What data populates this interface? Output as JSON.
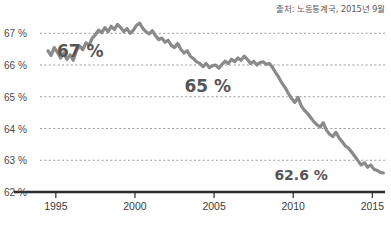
{
  "source_note": "출처: 노동통계국, 2015년 9월",
  "colors": {
    "line": "#8a8a8a",
    "gridline": "#9a9a9a",
    "axis": "#2b2b2b",
    "text": "#4a4a4a",
    "annotation": "#555555",
    "background": "#ffffff"
  },
  "annotations": [
    {
      "name": "annot-67",
      "text": "67 %",
      "x": 2.55,
      "y": 66.45
    },
    {
      "name": "annot-65",
      "text": "65 %",
      "x": 10.6,
      "y": 65.35
    },
    {
      "name": "annot-626",
      "text": "62.6 %",
      "x": 16.5,
      "y": 62.52
    }
  ],
  "chart_data": {
    "type": "line",
    "title": "",
    "subtitle": "",
    "xlabel": "",
    "ylabel": "",
    "xlim": [
      1994.0,
      2015.8
    ],
    "ylim": [
      62.0,
      67.45
    ],
    "grid": true,
    "grid_axis": "y",
    "legend": "none",
    "y_ticks": [
      62,
      63,
      64,
      65,
      66,
      67
    ],
    "y_ticklabels": [
      "62 %",
      "63 %",
      "64 %",
      "65 %",
      "66 %",
      "67 %"
    ],
    "x_ticks": [
      1995,
      2000,
      2005,
      2010,
      2015
    ],
    "x_ticklabels": [
      "1995",
      "2000",
      "2005",
      "2010",
      "2015"
    ],
    "series": [
      {
        "name": "Labor force participation rate",
        "units": "percent",
        "x": [
          1994.5,
          1994.7,
          1994.9,
          1995.1,
          1995.3,
          1995.5,
          1995.7,
          1995.9,
          1996.1,
          1996.3,
          1996.5,
          1996.7,
          1996.9,
          1997.1,
          1997.3,
          1997.5,
          1997.7,
          1997.9,
          1998.1,
          1998.3,
          1998.5,
          1998.7,
          1998.9,
          1999.1,
          1999.3,
          1999.5,
          1999.7,
          1999.9,
          2000.1,
          2000.3,
          2000.5,
          2000.7,
          2000.9,
          2001.1,
          2001.3,
          2001.5,
          2001.7,
          2001.9,
          2002.1,
          2002.3,
          2002.5,
          2002.7,
          2002.9,
          2003.1,
          2003.3,
          2003.5,
          2003.7,
          2003.9,
          2004.1,
          2004.3,
          2004.5,
          2004.7,
          2004.9,
          2005.1,
          2005.3,
          2005.5,
          2005.7,
          2005.9,
          2006.1,
          2006.3,
          2006.5,
          2006.7,
          2006.9,
          2007.1,
          2007.3,
          2007.5,
          2007.7,
          2007.9,
          2008.1,
          2008.3,
          2008.5,
          2008.7,
          2008.9,
          2009.1,
          2009.3,
          2009.5,
          2009.7,
          2009.9,
          2010.1,
          2010.3,
          2010.5,
          2010.7,
          2010.9,
          2011.1,
          2011.3,
          2011.5,
          2011.7,
          2011.9,
          2012.1,
          2012.3,
          2012.5,
          2012.7,
          2012.9,
          2013.1,
          2013.3,
          2013.5,
          2013.7,
          2013.9,
          2014.1,
          2014.3,
          2014.5,
          2014.7,
          2014.9,
          2015.1,
          2015.3,
          2015.5,
          2015.7
        ],
        "y": [
          66.45,
          66.3,
          66.55,
          66.4,
          66.22,
          66.38,
          66.18,
          66.32,
          66.15,
          66.45,
          66.6,
          66.48,
          66.7,
          66.62,
          66.85,
          66.95,
          67.1,
          67.02,
          67.18,
          67.05,
          67.22,
          67.12,
          67.28,
          67.18,
          67.05,
          67.15,
          67.0,
          67.1,
          67.25,
          67.32,
          67.15,
          67.05,
          66.98,
          67.08,
          66.92,
          66.8,
          66.85,
          66.72,
          66.78,
          66.62,
          66.55,
          66.68,
          66.5,
          66.38,
          66.45,
          66.28,
          66.2,
          66.1,
          66.05,
          65.95,
          66.05,
          65.92,
          65.98,
          66.0,
          65.9,
          66.02,
          66.12,
          66.05,
          66.18,
          66.1,
          66.22,
          66.15,
          66.28,
          66.18,
          66.05,
          66.12,
          66.0,
          66.08,
          66.1,
          66.02,
          66.05,
          65.92,
          65.75,
          65.6,
          65.42,
          65.28,
          65.1,
          64.95,
          64.82,
          64.98,
          64.72,
          64.58,
          64.48,
          64.35,
          64.22,
          64.12,
          64.05,
          64.18,
          63.95,
          63.82,
          63.75,
          63.88,
          63.7,
          63.58,
          63.45,
          63.38,
          63.25,
          63.12,
          62.98,
          62.85,
          62.92,
          62.78,
          62.85,
          62.72,
          62.68,
          62.62,
          62.6
        ]
      }
    ],
    "annotation_values": {
      "peak_label": "67 %",
      "mid_label": "65 %",
      "latest_label": "62.6 %"
    }
  }
}
